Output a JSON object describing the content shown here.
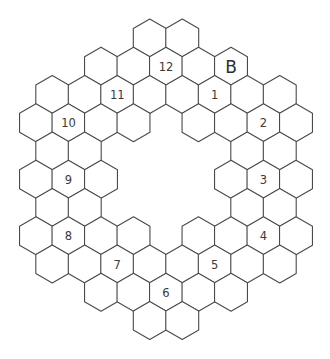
{
  "puzzle": {
    "type": "hexagonal-ring-puzzle",
    "colors": {
      "background": "#ffffff",
      "stroke": "#4a4a4a",
      "text": "#3a3a3a"
    },
    "grid": {
      "origin_x": 36,
      "col_step": 16.25,
      "origin_y": 38,
      "row_step": 28.25,
      "hex_size": 19
    },
    "cells": [
      {
        "r": 0,
        "c": 7,
        "label": ""
      },
      {
        "r": 0,
        "c": 9,
        "label": ""
      },
      {
        "r": 1,
        "c": 4,
        "label": ""
      },
      {
        "r": 1,
        "c": 6,
        "label": ""
      },
      {
        "r": 1,
        "c": 8,
        "label": "12"
      },
      {
        "r": 1,
        "c": 10,
        "label": ""
      },
      {
        "r": 1,
        "c": 12,
        "label": "B"
      },
      {
        "r": 2,
        "c": 1,
        "label": ""
      },
      {
        "r": 2,
        "c": 3,
        "label": ""
      },
      {
        "r": 2,
        "c": 5,
        "label": "11"
      },
      {
        "r": 2,
        "c": 7,
        "label": ""
      },
      {
        "r": 2,
        "c": 9,
        "label": ""
      },
      {
        "r": 2,
        "c": 11,
        "label": "1"
      },
      {
        "r": 2,
        "c": 13,
        "label": ""
      },
      {
        "r": 2,
        "c": 15,
        "label": ""
      },
      {
        "r": 3,
        "c": 0,
        "label": ""
      },
      {
        "r": 3,
        "c": 2,
        "label": "10"
      },
      {
        "r": 3,
        "c": 4,
        "label": ""
      },
      {
        "r": 3,
        "c": 6,
        "label": ""
      },
      {
        "r": 3,
        "c": 10,
        "label": ""
      },
      {
        "r": 3,
        "c": 12,
        "label": ""
      },
      {
        "r": 3,
        "c": 14,
        "label": "2"
      },
      {
        "r": 3,
        "c": 16,
        "label": ""
      },
      {
        "r": 4,
        "c": 1,
        "label": ""
      },
      {
        "r": 4,
        "c": 3,
        "label": ""
      },
      {
        "r": 4,
        "c": 13,
        "label": ""
      },
      {
        "r": 4,
        "c": 15,
        "label": ""
      },
      {
        "r": 5,
        "c": 0,
        "label": ""
      },
      {
        "r": 5,
        "c": 2,
        "label": "9"
      },
      {
        "r": 5,
        "c": 4,
        "label": ""
      },
      {
        "r": 5,
        "c": 12,
        "label": ""
      },
      {
        "r": 5,
        "c": 14,
        "label": "3"
      },
      {
        "r": 5,
        "c": 16,
        "label": ""
      },
      {
        "r": 6,
        "c": 1,
        "label": ""
      },
      {
        "r": 6,
        "c": 3,
        "label": ""
      },
      {
        "r": 6,
        "c": 13,
        "label": ""
      },
      {
        "r": 6,
        "c": 15,
        "label": ""
      },
      {
        "r": 7,
        "c": 0,
        "label": ""
      },
      {
        "r": 7,
        "c": 2,
        "label": "8"
      },
      {
        "r": 7,
        "c": 4,
        "label": ""
      },
      {
        "r": 7,
        "c": 6,
        "label": ""
      },
      {
        "r": 7,
        "c": 10,
        "label": ""
      },
      {
        "r": 7,
        "c": 12,
        "label": ""
      },
      {
        "r": 7,
        "c": 14,
        "label": "4"
      },
      {
        "r": 7,
        "c": 16,
        "label": ""
      },
      {
        "r": 8,
        "c": 1,
        "label": ""
      },
      {
        "r": 8,
        "c": 3,
        "label": ""
      },
      {
        "r": 8,
        "c": 5,
        "label": "7"
      },
      {
        "r": 8,
        "c": 7,
        "label": ""
      },
      {
        "r": 8,
        "c": 9,
        "label": ""
      },
      {
        "r": 8,
        "c": 11,
        "label": "5"
      },
      {
        "r": 8,
        "c": 13,
        "label": ""
      },
      {
        "r": 8,
        "c": 15,
        "label": ""
      },
      {
        "r": 9,
        "c": 4,
        "label": ""
      },
      {
        "r": 9,
        "c": 6,
        "label": ""
      },
      {
        "r": 9,
        "c": 8,
        "label": "6"
      },
      {
        "r": 9,
        "c": 10,
        "label": ""
      },
      {
        "r": 9,
        "c": 12,
        "label": ""
      },
      {
        "r": 10,
        "c": 7,
        "label": ""
      },
      {
        "r": 10,
        "c": 9,
        "label": ""
      }
    ]
  }
}
